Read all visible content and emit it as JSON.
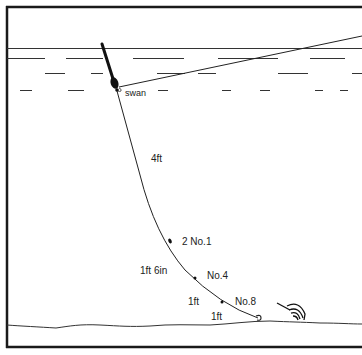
{
  "diagram": {
    "type": "fishing-rig-diagram",
    "labels": {
      "float_label": "swan",
      "upper_depth": "4ft",
      "shot_1": "2 No.1",
      "middle_depth": "1ft 6in",
      "shot_2": "No.4",
      "lower_depth": "1ft",
      "shot_3": "No.8",
      "hook_length": "1ft"
    },
    "colors": {
      "ink": "#1a1a1a",
      "background": "#ffffff"
    }
  }
}
